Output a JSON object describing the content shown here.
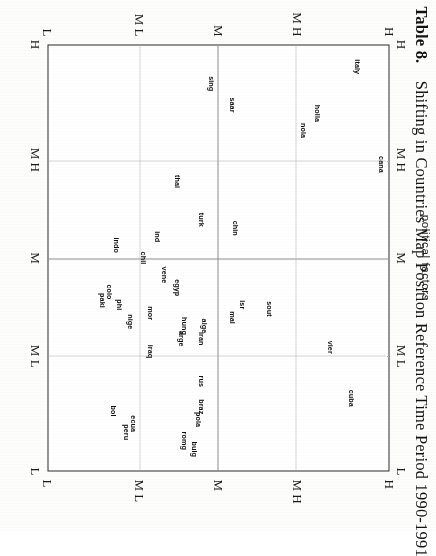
{
  "figure": {
    "table_number": "Table 8.",
    "title": "Shifting in Countries Map Position Reference Time Period 1990-1991",
    "full_title": "Table 8.   Shifting in Countries Map Position Reference Time Period 1990-1991",
    "axis_name_top": "political factors",
    "orientation_note": "rotated"
  },
  "chart_data": {
    "type": "scatter",
    "title": "Shifting in Countries Map Position Reference Time Period 1990-1991",
    "xlabel": "political factors",
    "ylabel": "",
    "grid": true,
    "legend": "none",
    "x_categories": [
      "H",
      "M H",
      "M",
      "M L",
      "L"
    ],
    "y_categories": [
      "H",
      "M H",
      "M",
      "M L",
      "L"
    ],
    "x_tick_positions_pct": [
      0,
      27,
      50,
      73,
      100
    ],
    "y_tick_positions_pct": [
      0,
      27,
      50,
      73,
      100
    ],
    "xlim": [
      0,
      100
    ],
    "ylim": [
      0,
      100
    ],
    "gridlines": {
      "solid_x_pct": [
        50
      ],
      "solid_y_pct": [
        50
      ],
      "dotted_x_pct": [
        27,
        73
      ],
      "dotted_y_pct": [
        27,
        73
      ]
    },
    "points": [
      {
        "label": "italy",
        "x": 5,
        "y": 9
      },
      {
        "label": "holla",
        "x": 16,
        "y": 21
      },
      {
        "label": "nola",
        "x": 20,
        "y": 25
      },
      {
        "label": "cana",
        "x": 28,
        "y": 2
      },
      {
        "label": "sing",
        "x": 9,
        "y": 52
      },
      {
        "label": "saar",
        "x": 14,
        "y": 46
      },
      {
        "label": "thai",
        "x": 32,
        "y": 62
      },
      {
        "label": "chin",
        "x": 43,
        "y": 45
      },
      {
        "label": "turk",
        "x": 41,
        "y": 55
      },
      {
        "label": "ind",
        "x": 45,
        "y": 68
      },
      {
        "label": "indo",
        "x": 47,
        "y": 80
      },
      {
        "label": "chil",
        "x": 50,
        "y": 72
      },
      {
        "label": "vene",
        "x": 54,
        "y": 66
      },
      {
        "label": "egyp",
        "x": 57,
        "y": 62
      },
      {
        "label": "colo",
        "x": 58,
        "y": 82
      },
      {
        "label": "paki",
        "x": 60,
        "y": 84
      },
      {
        "label": "phi",
        "x": 61,
        "y": 79
      },
      {
        "label": "sout",
        "x": 62,
        "y": 35
      },
      {
        "label": "isr",
        "x": 61,
        "y": 43
      },
      {
        "label": "mal",
        "x": 64,
        "y": 46
      },
      {
        "label": "mor",
        "x": 63,
        "y": 70
      },
      {
        "label": "nige",
        "x": 65,
        "y": 76
      },
      {
        "label": "hung",
        "x": 66,
        "y": 60
      },
      {
        "label": "alge",
        "x": 66,
        "y": 54
      },
      {
        "label": "iran",
        "x": 69,
        "y": 55
      },
      {
        "label": "arge",
        "x": 69,
        "y": 61
      },
      {
        "label": "iraq",
        "x": 72,
        "y": 70
      },
      {
        "label": "vier",
        "x": 71,
        "y": 17
      },
      {
        "label": "rus",
        "x": 79,
        "y": 55
      },
      {
        "label": "cuba",
        "x": 83,
        "y": 11
      },
      {
        "label": "braz",
        "x": 85,
        "y": 55
      },
      {
        "label": "pola",
        "x": 88,
        "y": 56
      },
      {
        "label": "bulg",
        "x": 95,
        "y": 57
      },
      {
        "label": "romg",
        "x": 93,
        "y": 60
      },
      {
        "label": "ecua",
        "x": 89,
        "y": 75
      },
      {
        "label": "peru",
        "x": 91,
        "y": 77
      },
      {
        "label": "bol",
        "x": 86,
        "y": 81
      }
    ]
  }
}
